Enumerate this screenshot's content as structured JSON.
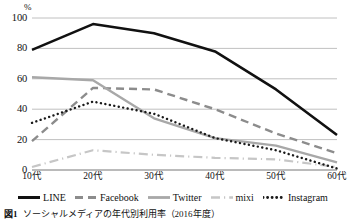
{
  "chart_data": {
    "type": "line",
    "title": "",
    "xlabel": "",
    "ylabel": "%",
    "ylim": [
      0,
      100
    ],
    "ytick_step": 20,
    "grid": true,
    "legend_position": "bottom",
    "categories": [
      "10代",
      "20代",
      "30代",
      "40代",
      "50代",
      "60代"
    ],
    "series": [
      {
        "name": "LINE",
        "values": [
          79,
          96,
          90,
          78,
          53,
          23
        ],
        "color": "#111111",
        "style": "solid",
        "width": 2.6
      },
      {
        "name": "Facebook",
        "values": [
          19,
          54,
          53,
          40,
          24,
          11
        ],
        "color": "#8c8c8c",
        "style": "dashed",
        "width": 2.4
      },
      {
        "name": "Twitter",
        "values": [
          61,
          59,
          34,
          21,
          16,
          5
        ],
        "color": "#a8a8a8",
        "style": "solid",
        "width": 2.4
      },
      {
        "name": "mixi",
        "values": [
          2,
          13,
          10,
          8,
          7,
          2
        ],
        "color": "#c6c6c6",
        "style": "dashdot",
        "width": 2.2
      },
      {
        "name": "Instagram",
        "values": [
          31,
          45,
          37,
          21,
          13,
          1
        ],
        "color": "#1a1a1a",
        "style": "dotted",
        "width": 2.4
      }
    ]
  },
  "axis": {
    "y_unit": "%",
    "y_ticks": [
      "100",
      "80",
      "60",
      "40",
      "20",
      "0"
    ],
    "x_ticks": [
      "10代",
      "20代",
      "30代",
      "40代",
      "50代",
      "60代"
    ]
  },
  "legend": {
    "items": [
      {
        "label": "LINE"
      },
      {
        "label": "Facebook"
      },
      {
        "label": "Twitter"
      },
      {
        "label": "mixi"
      },
      {
        "label": "Instagram"
      }
    ]
  },
  "caption": {
    "number": "図1",
    "text": "ソーシャルメディアの年代別利用率（2016年度）"
  },
  "colors": {
    "gridline": "#b9b9b9",
    "axis": "#777777",
    "text": "#111111",
    "background": "#ffffff"
  }
}
